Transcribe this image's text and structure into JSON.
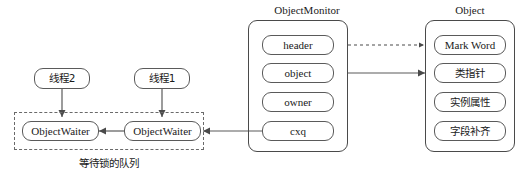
{
  "diagram": {
    "title_objectmonitor": "ObjectMonitor",
    "title_object": "Object",
    "caption_queue": "等待锁的队列",
    "threads": [
      {
        "label": "线程2"
      },
      {
        "label": "线程1"
      }
    ],
    "waiters": [
      {
        "label": "ObjectWaiter"
      },
      {
        "label": "ObjectWaiter"
      }
    ],
    "objectmonitor_fields": [
      {
        "label": "header"
      },
      {
        "label": "object"
      },
      {
        "label": "owner"
      },
      {
        "label": "cxq"
      }
    ],
    "object_fields": [
      {
        "label": "Mark Word"
      },
      {
        "label": "类指针"
      },
      {
        "label": "实例属性"
      },
      {
        "label": "字段补齐"
      }
    ],
    "colors": {
      "stroke": "#5a5a5a",
      "dashed_stroke": "#6a6a6a",
      "text": "#1a1a1a",
      "background": "#ffffff"
    }
  }
}
